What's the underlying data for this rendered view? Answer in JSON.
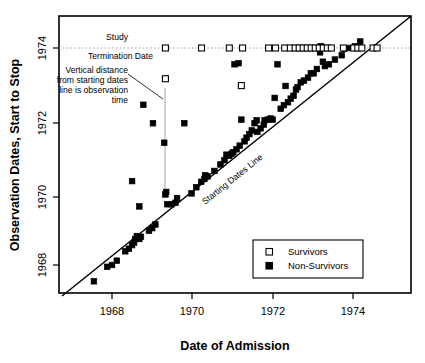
{
  "chart_data": {
    "type": "scatter",
    "title": "",
    "xlabel": "Date of Admission",
    "ylabel": "Observation Dates, Start to Stop",
    "xlim": [
      1966.7,
      1975.45
    ],
    "ylim": [
      1966.4,
      1974.6
    ],
    "xticks": [
      1968,
      1970,
      1972,
      1974
    ],
    "ytricks_note": "y axis ticks",
    "yticks": [
      1974,
      1972,
      1970,
      1968
    ],
    "xtick_labels": [
      "1968",
      "1970",
      "1972",
      "1974"
    ],
    "ytick_labels": [
      "1974",
      "1972",
      "1970",
      "1968"
    ],
    "grid": false,
    "legend_position": "lower-right",
    "legend": [
      {
        "label": "Survivors",
        "marker": "open-square"
      },
      {
        "label": "Non-Survivors",
        "marker": "filled-square"
      }
    ],
    "reference_lines": [
      {
        "name": "Starting Dates Line",
        "type": "identity",
        "label": "Starting Dates Line",
        "from": [
          1966.45,
          1966.45
        ],
        "to": [
          1974.72,
          1974.72
        ]
      },
      {
        "name": "Study Termination Date",
        "type": "horizontal",
        "y": 1974.0,
        "style": "dotted"
      }
    ],
    "annotations": [
      {
        "name": "study-termination",
        "lines": [
          "Study",
          "Termination Date"
        ]
      },
      {
        "name": "vertical-distance",
        "lines": [
          "Vertical distance",
          "from starting dates",
          "line is observation",
          "time"
        ]
      }
    ],
    "series": [
      {
        "name": "Survivors",
        "marker": "open-square",
        "points": [
          [
            1969.33,
            1974.0
          ],
          [
            1969.33,
            1973.15
          ],
          [
            1970.23,
            1974.0
          ],
          [
            1970.92,
            1974.0
          ],
          [
            1971.25,
            1974.0
          ],
          [
            1971.22,
            1972.96
          ],
          [
            1971.9,
            1974.0
          ],
          [
            1972.07,
            1974.0
          ],
          [
            1972.3,
            1974.0
          ],
          [
            1972.44,
            1974.0
          ],
          [
            1972.56,
            1974.0
          ],
          [
            1972.66,
            1974.0
          ],
          [
            1972.76,
            1974.0
          ],
          [
            1972.86,
            1974.0
          ],
          [
            1972.96,
            1974.0
          ],
          [
            1973.06,
            1974.0
          ],
          [
            1973.16,
            1974.0
          ],
          [
            1973.26,
            1974.0
          ],
          [
            1973.36,
            1974.0
          ],
          [
            1973.46,
            1974.0
          ],
          [
            1973.76,
            1974.0
          ],
          [
            1974.02,
            1974.0
          ],
          [
            1974.12,
            1974.0
          ],
          [
            1974.22,
            1974.0
          ],
          [
            1974.5,
            1974.0
          ],
          [
            1974.6,
            1974.0
          ]
        ]
      },
      {
        "name": "Non-Survivors",
        "marker": "filled-square",
        "points": [
          [
            1967.55,
            1967.55
          ],
          [
            1967.88,
            1967.95
          ],
          [
            1968.0,
            1968.0
          ],
          [
            1968.12,
            1968.12
          ],
          [
            1968.33,
            1968.38
          ],
          [
            1968.42,
            1968.45
          ],
          [
            1968.5,
            1968.55
          ],
          [
            1968.55,
            1968.62
          ],
          [
            1968.58,
            1968.72
          ],
          [
            1968.62,
            1968.8
          ],
          [
            1968.68,
            1968.72
          ],
          [
            1968.72,
            1968.78
          ],
          [
            1968.5,
            1970.32
          ],
          [
            1968.68,
            1969.62
          ],
          [
            1968.78,
            1972.43
          ],
          [
            1668.88,
            1969.0
          ],
          [
            1668.98,
            1969.0
          ],
          [
            1868.95,
            1969.05
          ],
          [
            1968.92,
            1968.95
          ],
          [
            1969.0,
            1969.02
          ],
          [
            1969.08,
            1969.12
          ],
          [
            1969.02,
            1971.92
          ],
          [
            1969.3,
            1971.38
          ],
          [
            1969.33,
            1969.95
          ],
          [
            1969.35,
            1970.02
          ],
          [
            1969.38,
            1969.68
          ],
          [
            1969.48,
            1969.68
          ],
          [
            1969.58,
            1969.72
          ],
          [
            1969.62,
            1969.85
          ],
          [
            1969.8,
            1971.92
          ],
          [
            1969.98,
            1969.98
          ],
          [
            1970.1,
            1970.15
          ],
          [
            1970.22,
            1970.3
          ],
          [
            1970.3,
            1970.38
          ],
          [
            1970.32,
            1970.48
          ],
          [
            1970.38,
            1970.45
          ],
          [
            1970.55,
            1970.6
          ],
          [
            1970.7,
            1970.78
          ],
          [
            1970.8,
            1970.9
          ],
          [
            1970.85,
            1971.05
          ],
          [
            1970.92,
            1971.02
          ],
          [
            1970.98,
            1971.08
          ],
          [
            1971.02,
            1971.12
          ],
          [
            1971.05,
            1973.55
          ],
          [
            1971.15,
            1973.58
          ],
          [
            1971.1,
            1971.2
          ],
          [
            1971.18,
            1971.3
          ],
          [
            1971.22,
            1972.02
          ],
          [
            1971.3,
            1971.42
          ],
          [
            1971.35,
            1971.52
          ],
          [
            1971.42,
            1971.62
          ],
          [
            1971.48,
            1971.72
          ],
          [
            1971.55,
            1971.92
          ],
          [
            1971.6,
            1972.0
          ],
          [
            1971.62,
            1971.68
          ],
          [
            1971.7,
            1971.78
          ],
          [
            1971.78,
            1971.88
          ],
          [
            1971.8,
            1972.0
          ],
          [
            1971.88,
            1972.02
          ],
          [
            1971.95,
            1972.05
          ],
          [
            1972.0,
            1972.02
          ],
          [
            1972.05,
            1972.62
          ],
          [
            1972.12,
            1973.55
          ],
          [
            1972.2,
            1972.32
          ],
          [
            1972.28,
            1972.42
          ],
          [
            1972.32,
            1972.95
          ],
          [
            1972.38,
            1972.5
          ],
          [
            1972.45,
            1972.6
          ],
          [
            1972.52,
            1972.68
          ],
          [
            1972.58,
            1972.85
          ],
          [
            1972.62,
            1972.92
          ],
          [
            1972.7,
            1973.05
          ],
          [
            1972.78,
            1973.1
          ],
          [
            1972.88,
            1973.18
          ],
          [
            1972.95,
            1973.3
          ],
          [
            1973.02,
            1973.3
          ],
          [
            1973.1,
            1973.42
          ],
          [
            1973.18,
            1973.88
          ],
          [
            1973.2,
            1974.05
          ],
          [
            1973.25,
            1973.62
          ],
          [
            1973.3,
            1973.5
          ],
          [
            1973.4,
            1973.55
          ],
          [
            1973.55,
            1973.68
          ],
          [
            1973.72,
            1973.8
          ],
          [
            1973.78,
            1973.98
          ],
          [
            1973.92,
            1974.0
          ],
          [
            1974.05,
            1974.05
          ],
          [
            1974.18,
            1974.18
          ]
        ]
      }
    ]
  },
  "axes": {
    "x_title": "Date of Admission",
    "y_title": "Observation Dates, Start to Stop",
    "x_ticks": [
      "1968",
      "1970",
      "1972",
      "1974"
    ],
    "y_ticks": [
      "1974",
      "1972",
      "1970",
      "1968"
    ]
  },
  "annotations": {
    "study": "Study",
    "termination_date": "Termination Date",
    "vd_line1": "Vertical distance",
    "vd_line2": "from starting dates",
    "vd_line3": "line is observation",
    "vd_line4": "time",
    "starting_dates_line": "Starting Dates Line"
  },
  "legend": {
    "survivors": "Survivors",
    "non_survivors": "Non-Survivors"
  },
  "colors": {
    "ink": "#000000",
    "background": "#ffffff",
    "guide": "#9a9a9a"
  }
}
